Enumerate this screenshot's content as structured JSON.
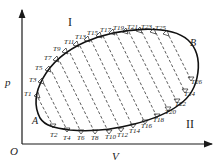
{
  "diagram": {
    "type": "p-V diagram",
    "axes": {
      "origin": "O",
      "y_label": "p",
      "x_label": "V"
    },
    "points": {
      "A": "A",
      "B": "B"
    },
    "regions": {
      "upper": "I",
      "lower": "II"
    },
    "upper_isotherms": [
      "T1",
      "T3",
      "T5",
      "T7",
      "T9",
      "T11",
      "T13",
      "T15",
      "T17",
      "T19",
      "T21",
      "T23",
      "T25"
    ],
    "lower_isotherms": [
      "T2",
      "T4",
      "T6",
      "T8",
      "T10",
      "T12",
      "T14",
      "T16",
      "T18",
      "T20",
      "T22",
      "T24",
      "T26"
    ],
    "colors": {
      "stroke": "#1a1a1a",
      "background": "#ffffff"
    }
  }
}
